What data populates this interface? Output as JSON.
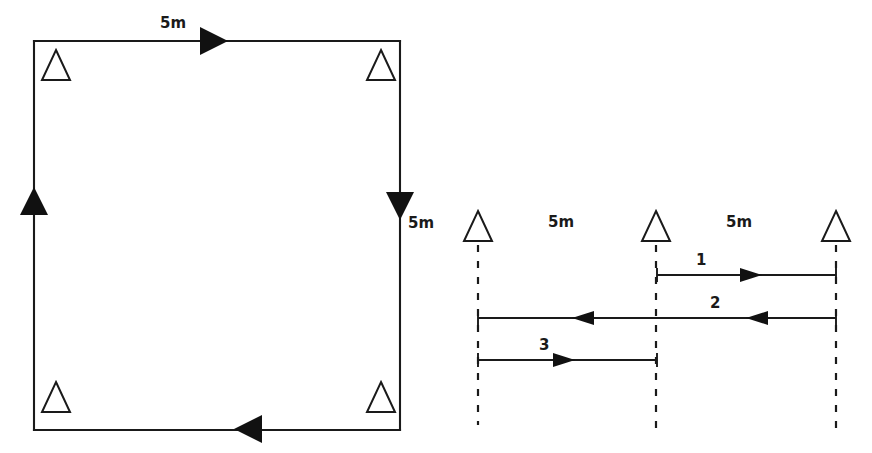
{
  "figure": {
    "background_color": "#ffffff",
    "ink_color": "#1a1a1a",
    "left_diagram": {
      "name": "closed-square-traverse",
      "labels": {
        "top_side": "5m",
        "right_side": "5m"
      },
      "stations": [
        {
          "id": "station-top-left",
          "label": ""
        },
        {
          "id": "station-top-right",
          "label": ""
        },
        {
          "id": "station-bottom-left",
          "label": ""
        },
        {
          "id": "station-bottom-right",
          "label": ""
        }
      ],
      "directions": {
        "top": "right",
        "right": "down",
        "bottom": "left",
        "left": "up"
      }
    },
    "right_diagram": {
      "name": "linear-level-run",
      "span_labels": [
        "5m",
        "5m"
      ],
      "runs": [
        {
          "id": "run-1",
          "label": "1",
          "direction": "right"
        },
        {
          "id": "run-2",
          "label": "2",
          "direction": "left"
        },
        {
          "id": "run-3",
          "label": "3",
          "direction": "right"
        }
      ],
      "stations": [
        {
          "id": "station-a",
          "label": ""
        },
        {
          "id": "station-b",
          "label": ""
        },
        {
          "id": "station-c",
          "label": ""
        }
      ]
    }
  }
}
